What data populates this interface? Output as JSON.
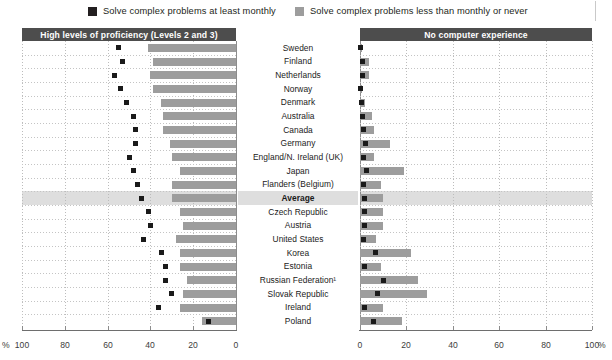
{
  "legend": {
    "items": [
      {
        "label": "Solve complex problems at least monthly",
        "swatch": "dark-square-icon",
        "color": "#231f20"
      },
      {
        "label": "Solve complex problems less than monthly or never",
        "swatch": "gray-square-icon",
        "color": "#9d9d9d"
      }
    ]
  },
  "panels": {
    "left": {
      "title": "High levels of proficiency (Levels 2 and 3)"
    },
    "right": {
      "title": "No computer experience"
    }
  },
  "axis": {
    "left_ticks": [
      "100",
      "80",
      "60",
      "40",
      "20",
      "0"
    ],
    "right_ticks": [
      "0",
      "20",
      "40",
      "60",
      "80",
      "100"
    ],
    "unit_left": "%",
    "unit_right": "%"
  },
  "highlight_row": "Average",
  "chart_data": {
    "type": "bar",
    "xlabel": "%",
    "ylabel": "",
    "grid": true,
    "legend_position": "top",
    "categories": [
      "Sweden",
      "Finland",
      "Netherlands",
      "Norway",
      "Denmark",
      "Australia",
      "Canada",
      "Germany",
      "England/N. Ireland (UK)",
      "Japan",
      "Flanders (Belgium)",
      "Average",
      "Czech Republic",
      "Austria",
      "United States",
      "Korea",
      "Estonia",
      "Russian Federation¹",
      "Slovak Republic",
      "Ireland",
      "Poland"
    ],
    "panels": [
      {
        "name": "High levels of proficiency (Levels 2 and 3)",
        "axis_direction": "reversed",
        "xlim": [
          0,
          100
        ],
        "series": [
          {
            "name": "Solve complex problems less than monthly or never",
            "type": "bar",
            "color": "#9d9d9d",
            "values": [
              41,
              39,
              40,
              39,
              35,
              34,
              34,
              31,
              30,
              26,
              30,
              30,
              26,
              25,
              28,
              26,
              26,
              23,
              25,
              26,
              16
            ]
          },
          {
            "name": "Solve complex problems at least monthly",
            "type": "marker",
            "color": "#1a1a1a",
            "values": [
              55,
              53,
              57,
              54,
              51,
              48,
              47,
              47,
              50,
              48,
              46,
              44,
              41,
              40,
              43,
              35,
              33,
              33,
              30,
              36,
              13
            ]
          }
        ]
      },
      {
        "name": "No computer experience",
        "axis_direction": "normal",
        "xlim": [
          0,
          100
        ],
        "series": [
          {
            "name": "Solve complex problems less than monthly or never",
            "type": "bar",
            "color": "#9d9d9d",
            "values": [
              1,
              4,
              4,
              1,
              2,
              5,
              6,
              13,
              6,
              19,
              9,
              10,
              10,
              10,
              7,
              22,
              9,
              25,
              29,
              10,
              18
            ]
          },
          {
            "name": "Solve complex problems at least monthly",
            "type": "marker",
            "color": "#1a1a1a",
            "values": [
              0.4,
              1,
              1,
              0.3,
              0.6,
              1.2,
              1.4,
              2.5,
              1.3,
              2.6,
              1.6,
              2.0,
              2.0,
              2.0,
              1.6,
              6.5,
              2.0,
              10.0,
              7.5,
              2.0,
              6.0
            ]
          }
        ]
      }
    ]
  }
}
